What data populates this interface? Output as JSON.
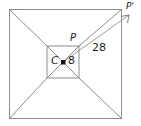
{
  "figure": {
    "type": "geometry-diagram",
    "background_color": "#ffffff",
    "line_color": "#8c8c8c",
    "dim_line_color": "#9a9a9a",
    "point_color": "#111111",
    "label_color": "#1a1a1a",
    "labels": {
      "center": "C",
      "inner_segment": "8",
      "point_p": "P",
      "point_p_prime": "P'",
      "dimension": "28"
    },
    "shapes": {
      "outer_square": {
        "x": 9,
        "y": 9,
        "width": 113,
        "height": 110
      },
      "inner_square": {
        "x": 47,
        "y": 46,
        "width": 32,
        "height": 32
      },
      "center_point": {
        "x": 63,
        "y": 62,
        "size": 4
      }
    },
    "dimension_line": {
      "from_x": 63,
      "from_y": 62,
      "to_x": 130,
      "to_y": 14,
      "value": "28",
      "arrow": "arrowhead-up-right"
    }
  }
}
